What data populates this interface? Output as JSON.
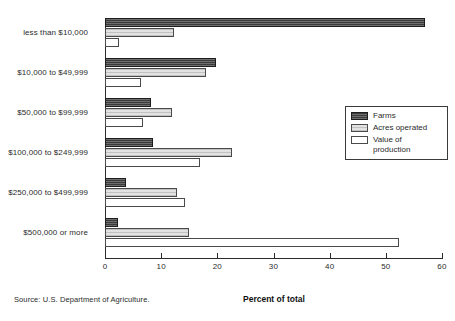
{
  "chart_data": {
    "type": "bar",
    "orientation": "horizontal",
    "grouped": true,
    "title": "",
    "xlabel": "Percent of total",
    "ylabel": "",
    "xlim": [
      0,
      60
    ],
    "xticks": [
      0,
      10,
      20,
      30,
      40,
      50,
      60
    ],
    "xtick_labels": [
      "0",
      "10",
      "20",
      "30",
      "40",
      "50",
      "60"
    ],
    "grid": false,
    "legend_position": "right",
    "categories": [
      "less than $10,000",
      "$10,000 to $49,999",
      "$50,000 to $99,999",
      "$100,000 to $249,999",
      "$250,000 to $499,999",
      "$500,000 or more"
    ],
    "series": [
      {
        "name": "Farms",
        "color": "#3b3b3b",
        "values": [
          57.0,
          19.7,
          8.2,
          8.5,
          3.8,
          2.3
        ]
      },
      {
        "name": "Acres operated",
        "color": "#e2e2e2",
        "values": [
          12.3,
          18.0,
          11.9,
          22.6,
          12.8,
          15.0
        ]
      },
      {
        "name": "Value of production",
        "color": "#ffffff",
        "values": [
          2.5,
          6.4,
          6.7,
          17.0,
          14.2,
          52.3
        ]
      }
    ],
    "source_note": "Source: U.S. Department of Agriculture."
  },
  "legend": {
    "entries": [
      {
        "label": "Farms"
      },
      {
        "label": "Acres operated"
      },
      {
        "label": "Value of\nproduction"
      }
    ]
  }
}
